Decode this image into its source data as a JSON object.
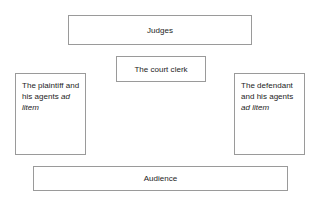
{
  "diagram": {
    "background_color": "#ffffff",
    "border_color": "#9a9a9a",
    "text_color": "#1c1c1c",
    "boxes": [
      {
        "id": "judges",
        "label": "Judges",
        "align": "center"
      },
      {
        "id": "court_clerk",
        "label": "The court clerk",
        "align": "center"
      },
      {
        "id": "plaintiff",
        "label_plain": "The plaintiff and his agents ",
        "label_italic": "ad litem",
        "align": "left"
      },
      {
        "id": "defendant",
        "label_plain": "The defendant and his agents ",
        "label_italic": "ad litem",
        "align": "left"
      },
      {
        "id": "audience",
        "label": "Audience",
        "align": "center"
      }
    ]
  }
}
